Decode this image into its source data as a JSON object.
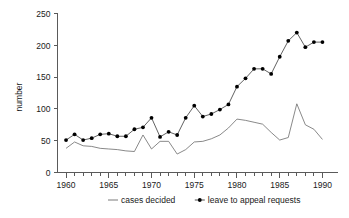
{
  "chart_data": {
    "type": "line",
    "title": "",
    "xlabel": "",
    "ylabel": "number",
    "xlim": [
      1959,
      1991
    ],
    "ylim": [
      0,
      250
    ],
    "grid": false,
    "legend_position": "bottom",
    "x_tick_labels": [
      "1960",
      "1965",
      "1970",
      "1975",
      "1980",
      "1985",
      "1990"
    ],
    "x_tick_values": [
      1960,
      1965,
      1970,
      1975,
      1980,
      1985,
      1990
    ],
    "x_minor_ticks_every": 1,
    "y_tick_labels": [
      "0",
      "50",
      "100",
      "150",
      "200",
      "250"
    ],
    "y_tick_values": [
      0,
      50,
      100,
      150,
      200,
      250
    ],
    "x": [
      1960,
      1961,
      1962,
      1963,
      1964,
      1965,
      1966,
      1967,
      1968,
      1969,
      1970,
      1971,
      1972,
      1973,
      1974,
      1975,
      1976,
      1977,
      1978,
      1979,
      1980,
      1981,
      1982,
      1983,
      1984,
      1985,
      1986,
      1987,
      1988,
      1989,
      1990
    ],
    "series": [
      {
        "name": "cases decided",
        "marker": "none",
        "color": "#6b6b6b",
        "values": [
          38,
          48,
          42,
          41,
          38,
          37,
          36,
          34,
          33,
          59,
          37,
          49,
          49,
          29,
          36,
          48,
          49,
          53,
          59,
          70,
          84,
          82,
          79,
          76,
          63,
          51,
          55,
          108,
          75,
          68,
          52
        ]
      },
      {
        "name": "leave to appeal requests",
        "marker": "filled-circle",
        "color": "#000000",
        "values": [
          51,
          60,
          51,
          54,
          60,
          61,
          57,
          57,
          68,
          71,
          86,
          56,
          64,
          59,
          86,
          105,
          88,
          92,
          99,
          107,
          135,
          148,
          163,
          163,
          155,
          182,
          207,
          220,
          197,
          205,
          205
        ]
      }
    ],
    "series_display": [
      {
        "name": "cases decided",
        "marker": "none",
        "color": "#6b6b6b",
        "values": [
          38,
          48,
          42,
          41,
          38,
          37,
          36,
          34,
          33,
          59,
          37,
          49,
          49,
          29,
          36,
          48,
          49,
          53,
          59,
          70,
          84,
          82,
          79,
          76,
          63,
          51,
          55,
          108,
          75,
          68,
          52
        ]
      },
      {
        "name": "leave to appeal requests",
        "marker": "filled-circle",
        "color": "#000000",
        "values": [
          51,
          60,
          51,
          54,
          60,
          61,
          57,
          57,
          68,
          71,
          86,
          56,
          64,
          59,
          86,
          105,
          88,
          92,
          99,
          107,
          135,
          163,
          163,
          155,
          182,
          207,
          220,
          197,
          205
        ]
      }
    ]
  },
  "legend": {
    "items": [
      {
        "label": "cases decided",
        "symbol": "line"
      },
      {
        "label": "leave to appeal requests",
        "symbol": "line-with-dot"
      }
    ]
  },
  "axis": {
    "y_title": "number"
  }
}
